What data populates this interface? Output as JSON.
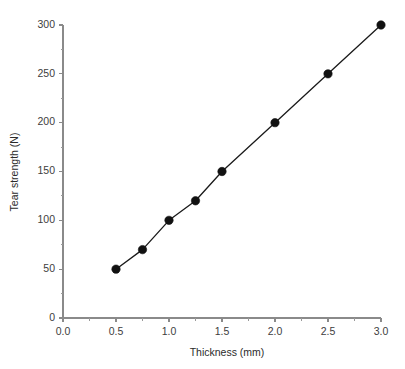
{
  "chart_data": {
    "type": "line",
    "title": "",
    "subtitle": "",
    "xlabel": "Thickness (mm)",
    "ylabel": "Tear strength (N)",
    "xlim": [
      0.0,
      3.0
    ],
    "ylim": [
      0,
      300
    ],
    "grid": false,
    "legend": null,
    "x": [
      0.5,
      0.75,
      1.0,
      1.25,
      1.5,
      2.0,
      2.5,
      3.0
    ],
    "values": [
      50,
      70,
      100,
      120,
      150,
      200,
      250,
      300
    ],
    "series": [
      {
        "name": "Tear strength",
        "x": [
          0.5,
          0.75,
          1.0,
          1.25,
          1.5,
          2.0,
          2.5,
          3.0
        ],
        "values": [
          50,
          70,
          100,
          120,
          150,
          200,
          250,
          300
        ],
        "marker": "filled-circle",
        "color": "#111111"
      }
    ],
    "x_ticks": [
      0.0,
      0.5,
      1.0,
      1.5,
      2.0,
      2.5,
      3.0
    ],
    "x_tick_labels": [
      "0.0",
      "0.5",
      "1.0",
      "1.5",
      "2.0",
      "2.5",
      "3.0"
    ],
    "x_minor_step": 0.25,
    "y_ticks": [
      0,
      50,
      100,
      150,
      200,
      250,
      300
    ],
    "y_tick_labels": [
      "0",
      "50",
      "100",
      "150",
      "200",
      "250",
      "300"
    ],
    "y_minor_step": 25,
    "axis_color": "#8a8a8a",
    "line_color": "#111111",
    "marker_color": "#111111",
    "background_color": "#ffffff"
  }
}
